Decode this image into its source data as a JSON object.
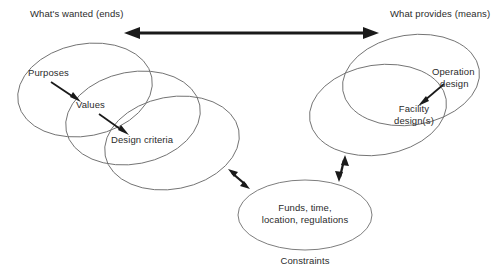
{
  "diagram": {
    "title_ends": "What's wanted (ends)",
    "title_means": "What provides (means)",
    "left_cluster": {
      "labels": {
        "purposes": "Purposes",
        "values": "Values",
        "design_criteria": "Design criteria"
      }
    },
    "right_cluster": {
      "labels": {
        "operation_design_line1": "Operation",
        "operation_design_line2": "design",
        "facility_design_line1": "Facility",
        "facility_design_line2": "design(s)"
      }
    },
    "constraints_cluster": {
      "labels": {
        "contents_line1": "Funds, time,",
        "contents_line2": "location, regulations",
        "caption": "Constraints"
      }
    },
    "colors": {
      "background": "#ffffff",
      "ellipse_stroke": "#6e6e6e",
      "arrow_fill": "#1a1a1a",
      "text": "#2b2b2b"
    },
    "icons": {
      "main_link": "double-headed-arrow-icon",
      "left_constraint_link": "double-headed-arrow-icon",
      "right_constraint_link": "double-headed-arrow-icon",
      "purposes_pointer": "arrow-icon",
      "values_pointer": "arrow-icon",
      "operation_pointer": "arrow-icon"
    }
  }
}
